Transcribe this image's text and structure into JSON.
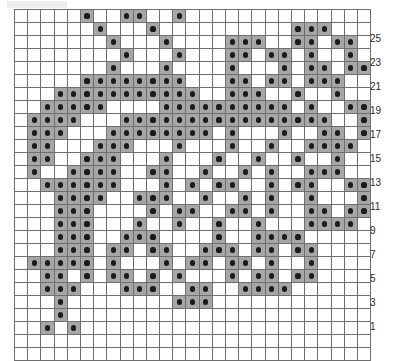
{
  "chart_data": {
    "type": "heatmap",
    "title": "",
    "subtitle": "",
    "xlabel": "",
    "ylabel": "",
    "legend_position": "none",
    "grid": true,
    "columns": 27,
    "rows": 27,
    "cell_states": [
      "empty",
      "filled"
    ],
    "fill_color": "#a6a6a6",
    "dot_color": "#1b1b1b",
    "empty_color": "#ffffff",
    "gridline_color": "#6f6f6f",
    "row_axis": {
      "label_side": "right",
      "order": "bottom-to-top",
      "tick_labels": [
        "1",
        "",
        "3",
        "",
        "5",
        "",
        "7",
        "",
        "9",
        "",
        "11",
        "",
        "13",
        "",
        "15",
        "",
        "17",
        "",
        "19",
        "",
        "21",
        "",
        "23",
        "",
        "25",
        "",
        ""
      ],
      "labeled_values": [
        1,
        3,
        5,
        7,
        9,
        11,
        13,
        15,
        17,
        19,
        21,
        23,
        25
      ]
    },
    "column_axis": {
      "tick_labels": [],
      "count": 27
    },
    "matrix_note": "Each inner array is one chart row, listed top row first. 1 = filled stitch (grey cell with black dot), 0 = empty.",
    "matrix": [
      [
        0,
        0,
        0,
        0,
        0,
        1,
        0,
        0,
        1,
        1,
        0,
        0,
        1,
        0,
        0,
        0,
        0,
        0,
        0,
        0,
        0,
        0,
        0,
        0,
        0,
        0,
        0
      ],
      [
        0,
        0,
        0,
        0,
        0,
        0,
        1,
        0,
        0,
        0,
        1,
        0,
        0,
        0,
        0,
        0,
        0,
        0,
        0,
        0,
        0,
        1,
        1,
        1,
        0,
        0,
        0
      ],
      [
        0,
        0,
        0,
        0,
        0,
        0,
        0,
        1,
        0,
        0,
        0,
        1,
        0,
        0,
        0,
        0,
        1,
        1,
        1,
        0,
        0,
        1,
        1,
        0,
        1,
        1,
        0
      ],
      [
        0,
        0,
        0,
        0,
        0,
        0,
        0,
        0,
        1,
        0,
        0,
        0,
        1,
        0,
        0,
        0,
        1,
        1,
        0,
        1,
        1,
        0,
        1,
        0,
        0,
        1,
        0
      ],
      [
        0,
        0,
        0,
        0,
        0,
        0,
        0,
        1,
        0,
        0,
        0,
        1,
        0,
        0,
        0,
        0,
        1,
        0,
        0,
        0,
        1,
        0,
        1,
        1,
        0,
        1,
        1
      ],
      [
        0,
        0,
        0,
        0,
        0,
        1,
        1,
        1,
        1,
        1,
        1,
        1,
        1,
        0,
        0,
        0,
        1,
        1,
        0,
        1,
        1,
        0,
        1,
        1,
        1,
        0,
        0
      ],
      [
        0,
        0,
        0,
        1,
        1,
        1,
        1,
        1,
        1,
        1,
        1,
        1,
        1,
        1,
        0,
        0,
        1,
        1,
        1,
        0,
        0,
        1,
        0,
        0,
        1,
        0,
        0
      ],
      [
        0,
        0,
        1,
        1,
        1,
        1,
        1,
        0,
        0,
        0,
        0,
        1,
        1,
        1,
        1,
        1,
        1,
        1,
        1,
        1,
        1,
        0,
        1,
        0,
        0,
        1,
        1
      ],
      [
        0,
        1,
        1,
        1,
        1,
        0,
        0,
        0,
        1,
        1,
        1,
        1,
        1,
        1,
        1,
        1,
        1,
        1,
        1,
        1,
        1,
        1,
        1,
        1,
        0,
        0,
        1
      ],
      [
        0,
        1,
        1,
        1,
        0,
        0,
        0,
        1,
        1,
        1,
        1,
        1,
        1,
        1,
        1,
        0,
        1,
        0,
        0,
        0,
        1,
        0,
        0,
        1,
        1,
        0,
        1
      ],
      [
        0,
        1,
        1,
        0,
        0,
        0,
        1,
        1,
        1,
        0,
        0,
        0,
        1,
        0,
        0,
        0,
        1,
        0,
        0,
        1,
        0,
        0,
        1,
        1,
        1,
        1,
        0
      ],
      [
        0,
        1,
        1,
        0,
        0,
        1,
        1,
        1,
        0,
        0,
        0,
        1,
        0,
        0,
        0,
        1,
        0,
        0,
        1,
        0,
        0,
        1,
        0,
        0,
        1,
        0,
        0
      ],
      [
        0,
        1,
        0,
        0,
        1,
        1,
        1,
        1,
        0,
        0,
        1,
        1,
        0,
        0,
        1,
        0,
        0,
        1,
        0,
        1,
        0,
        0,
        1,
        1,
        1,
        0,
        0
      ],
      [
        0,
        0,
        1,
        1,
        1,
        1,
        1,
        1,
        0,
        0,
        0,
        1,
        0,
        1,
        0,
        1,
        1,
        0,
        0,
        1,
        0,
        1,
        1,
        0,
        0,
        1,
        1
      ],
      [
        0,
        0,
        0,
        1,
        1,
        1,
        1,
        0,
        0,
        1,
        1,
        1,
        0,
        0,
        1,
        0,
        0,
        1,
        0,
        1,
        0,
        0,
        1,
        0,
        0,
        0,
        1
      ],
      [
        0,
        0,
        0,
        1,
        1,
        1,
        0,
        0,
        0,
        0,
        1,
        0,
        1,
        1,
        0,
        0,
        1,
        1,
        0,
        1,
        0,
        0,
        1,
        1,
        0,
        1,
        1
      ],
      [
        0,
        0,
        0,
        1,
        1,
        1,
        0,
        0,
        0,
        1,
        0,
        0,
        1,
        0,
        0,
        1,
        0,
        0,
        1,
        0,
        0,
        0,
        1,
        1,
        1,
        1,
        0
      ],
      [
        0,
        0,
        0,
        1,
        1,
        1,
        0,
        0,
        1,
        1,
        1,
        0,
        0,
        0,
        0,
        1,
        0,
        0,
        1,
        1,
        1,
        1,
        0,
        0,
        0,
        0,
        0
      ],
      [
        0,
        0,
        0,
        1,
        1,
        1,
        0,
        1,
        1,
        0,
        1,
        1,
        0,
        0,
        1,
        1,
        1,
        0,
        1,
        1,
        0,
        1,
        1,
        0,
        0,
        0,
        0
      ],
      [
        0,
        1,
        1,
        1,
        1,
        1,
        0,
        1,
        0,
        0,
        0,
        1,
        0,
        1,
        1,
        0,
        1,
        1,
        0,
        1,
        0,
        0,
        1,
        0,
        0,
        0,
        0
      ],
      [
        0,
        0,
        1,
        1,
        0,
        1,
        0,
        1,
        1,
        0,
        1,
        0,
        1,
        0,
        0,
        0,
        1,
        0,
        1,
        1,
        0,
        1,
        1,
        0,
        0,
        0,
        0
      ],
      [
        0,
        0,
        1,
        1,
        1,
        0,
        0,
        0,
        1,
        1,
        1,
        0,
        0,
        1,
        1,
        0,
        0,
        1,
        1,
        1,
        1,
        0,
        0,
        0,
        0,
        0,
        0
      ],
      [
        0,
        0,
        0,
        1,
        0,
        0,
        0,
        0,
        0,
        0,
        0,
        0,
        1,
        1,
        1,
        0,
        0,
        0,
        0,
        0,
        0,
        0,
        0,
        0,
        0,
        0,
        0
      ],
      [
        0,
        0,
        0,
        1,
        0,
        0,
        0,
        0,
        0,
        0,
        0,
        0,
        0,
        0,
        0,
        0,
        0,
        0,
        0,
        0,
        0,
        0,
        0,
        0,
        0,
        0,
        0
      ],
      [
        0,
        0,
        1,
        0,
        1,
        0,
        0,
        0,
        0,
        0,
        0,
        0,
        0,
        0,
        0,
        0,
        0,
        0,
        0,
        0,
        0,
        0,
        0,
        0,
        0,
        0,
        0
      ],
      [
        0,
        0,
        0,
        0,
        0,
        0,
        0,
        0,
        0,
        0,
        0,
        0,
        0,
        0,
        0,
        0,
        0,
        0,
        0,
        0,
        0,
        0,
        0,
        0,
        0,
        0,
        0
      ],
      [
        0,
        0,
        0,
        0,
        0,
        0,
        0,
        0,
        0,
        0,
        0,
        0,
        0,
        0,
        0,
        0,
        0,
        0,
        0,
        0,
        0,
        0,
        0,
        0,
        0,
        0,
        0
      ]
    ]
  }
}
